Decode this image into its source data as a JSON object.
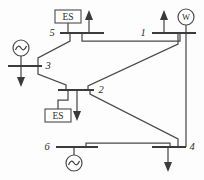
{
  "diagram": {
    "type": "single-line-diagram",
    "canvas": {
      "width": 204,
      "height": 180
    },
    "background_color": "#fdfdfd",
    "line_color": "#4a4a4a",
    "bus_color": "#3b3b3b",
    "buses": [
      {
        "id": "bus-5",
        "label": "5",
        "label_x": 52,
        "label_y": 36,
        "x1": 60,
        "x2": 104,
        "y": 33
      },
      {
        "id": "bus-1",
        "label": "1",
        "label_x": 143,
        "label_y": 36,
        "x1": 152,
        "x2": 196,
        "y": 33
      },
      {
        "id": "bus-3",
        "label": "3",
        "label_x": 46,
        "label_y": 69,
        "x1": 8,
        "x2": 42,
        "y": 66
      },
      {
        "id": "bus-2",
        "label": "2",
        "label_x": 99,
        "label_y": 93,
        "x1": 58,
        "x2": 94,
        "y": 90
      },
      {
        "id": "bus-6",
        "label": "6",
        "label_x": 47,
        "label_y": 150,
        "x1": 56,
        "x2": 98,
        "y": 147
      },
      {
        "id": "bus-4",
        "label": "4",
        "label_x": 190,
        "label_y": 150,
        "x1": 152,
        "x2": 186,
        "y": 147
      }
    ],
    "devices": [
      {
        "id": "es-bus-5",
        "kind": "energy-storage",
        "label": "ES",
        "x": 55,
        "y": 10,
        "w": 26,
        "h": 13
      },
      {
        "id": "es-bus-2",
        "kind": "energy-storage",
        "label": "ES",
        "x": 45,
        "y": 109,
        "w": 26,
        "h": 13
      },
      {
        "id": "wind-bus-1",
        "kind": "wind-generator",
        "label": "W",
        "cx": 186,
        "cy": 17,
        "r": 8
      },
      {
        "id": "gen-bus-3",
        "kind": "synchronous-generator",
        "label": "",
        "cx": 21,
        "cy": 48,
        "r": 8
      },
      {
        "id": "gen-bus-6",
        "kind": "synchronous-generator",
        "label": "",
        "cx": 74,
        "cy": 163,
        "r": 8
      }
    ],
    "injections": [
      {
        "id": "inject-bus-5",
        "direction": "up",
        "x": 89,
        "y_tip": 11,
        "y_base": 33
      },
      {
        "id": "inject-bus-1",
        "direction": "up",
        "x": 164,
        "y_tip": 11,
        "y_base": 33
      },
      {
        "id": "load-bus-3",
        "direction": "down",
        "x": 21,
        "y_base": 66,
        "y_tip": 87
      },
      {
        "id": "load-bus-2",
        "direction": "down",
        "x": 77,
        "y_base": 90,
        "y_tip": 121
      },
      {
        "id": "load-bus-4",
        "direction": "down",
        "x": 168,
        "y_base": 147,
        "y_tip": 172
      }
    ],
    "branches": [
      {
        "id": "line-5-3",
        "from": "5",
        "to": "3",
        "path": "M 70 33 L 70 41 L 38 58 L 38 66"
      },
      {
        "id": "line-3-2",
        "from": "3",
        "to": "2",
        "path": "M 38 66 L 38 74 L 66 85 L 66 90"
      },
      {
        "id": "line-5-1",
        "from": "5",
        "to": "1",
        "path": "M 82 33 L 82 41 L 180 41 L 180 33"
      },
      {
        "id": "line-1-2",
        "from": "1",
        "to": "2",
        "path": "M 178 33 L 178 44 L 88 86 L 88 90"
      },
      {
        "id": "line-2-4",
        "from": "2",
        "to": "4",
        "path": "M 90 90 L 90 94 L 178 139 L 178 147"
      },
      {
        "id": "line-6-4",
        "from": "6",
        "to": "4",
        "path": "M 86 147 L 86 143 L 170 143 L 170 147"
      },
      {
        "id": "line-1-4-vertical",
        "from": "1",
        "to": "4",
        "path": "M 186 33 L 186 147"
      }
    ],
    "stubs": [
      {
        "id": "stub-es-5",
        "path": "M 68 23 L 68 33"
      },
      {
        "id": "stub-es-2",
        "path": "M 58 116 L 58 100 L 68 100 L 68 90"
      },
      {
        "id": "stub-wind-1",
        "path": "M 186 25 L 186 33"
      },
      {
        "id": "stub-gen-3",
        "path": "M 21 56 L 21 66"
      },
      {
        "id": "stub-gen-6",
        "path": "M 74 155 L 74 147"
      }
    ]
  }
}
